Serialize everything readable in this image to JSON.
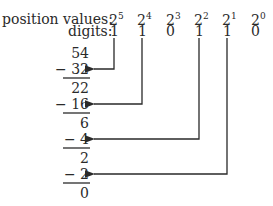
{
  "header": {
    "position_label": "position values:",
    "digits_label": "digits:"
  },
  "positions": [
    {
      "base": "2",
      "exp": "5"
    },
    {
      "base": "2",
      "exp": "4"
    },
    {
      "base": "2",
      "exp": "3"
    },
    {
      "base": "2",
      "exp": "2"
    },
    {
      "base": "2",
      "exp": "1"
    },
    {
      "base": "2",
      "exp": "0"
    }
  ],
  "digits": [
    "1",
    "1",
    "0",
    "1",
    "1",
    "0"
  ],
  "steps": [
    {
      "value": "54"
    },
    {
      "value": "− 32"
    },
    {
      "value": "22"
    },
    {
      "value": "− 16"
    },
    {
      "value": "6"
    },
    {
      "value": "−  4"
    },
    {
      "value": "2"
    },
    {
      "value": "−  2"
    },
    {
      "value": "0"
    }
  ]
}
